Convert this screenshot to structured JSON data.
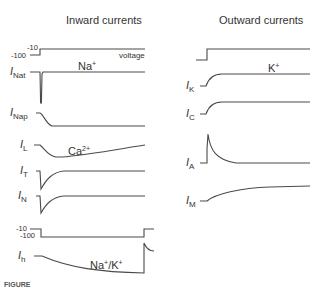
{
  "figure": {
    "left_panel": {
      "title": "Inward currents",
      "voltage_protocol_1": {
        "high_label": "-10",
        "low_label": "-100",
        "trace_label": "voltage"
      },
      "traces": [
        {
          "id": "INat",
          "symbol": "I",
          "subscript": "Nat",
          "ion_label": "Na",
          "ion_charge": "+"
        },
        {
          "id": "INap",
          "symbol": "I",
          "subscript": "Nap"
        },
        {
          "id": "IL",
          "symbol": "I",
          "subscript": "L",
          "ion_label": "Ca",
          "ion_charge": "2+"
        },
        {
          "id": "IT",
          "symbol": "I",
          "subscript": "T"
        },
        {
          "id": "IN",
          "symbol": "I",
          "subscript": "N"
        }
      ],
      "voltage_protocol_2": {
        "high_label": "-10",
        "low_label": "-100"
      },
      "hyperpolarization_trace": {
        "id": "Ih",
        "symbol": "I",
        "subscript": "h",
        "ion_label": "Na",
        "ion_charge": "+",
        "ion_label_2": "/K",
        "ion_charge_2": "+"
      }
    },
    "right_panel": {
      "title": "Outward currents",
      "traces": [
        {
          "id": "IK",
          "symbol": "I",
          "subscript": "K",
          "ion_label": "K",
          "ion_charge": "+"
        },
        {
          "id": "IC",
          "symbol": "I",
          "subscript": "C"
        },
        {
          "id": "IA",
          "symbol": "I",
          "subscript": "A"
        },
        {
          "id": "IM",
          "symbol": "I",
          "subscript": "M"
        }
      ]
    },
    "caption_fragment": "FIGURE",
    "trace_color": "#4a4a4a"
  }
}
